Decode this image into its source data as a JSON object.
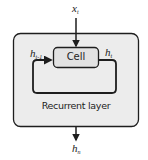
{
  "diagram": {
    "input_label": {
      "base": "x",
      "sub": "t"
    },
    "prev_state_label": {
      "base": "h",
      "sub": "t-1"
    },
    "state_label": {
      "base": "h",
      "sub": "t"
    },
    "output_label": {
      "base": "h",
      "sub": "n"
    },
    "cell_label": "Cell",
    "layer_label": "Recurrent layer",
    "colors": {
      "layer_fill": "#ececec",
      "cell_fill": "#e2e2e2",
      "stroke": "#1e1e1e"
    }
  }
}
